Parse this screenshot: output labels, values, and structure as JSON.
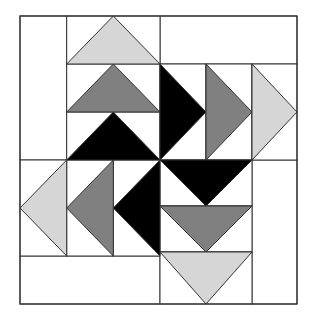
{
  "colors": {
    "background": "#ffffff",
    "stroke": "#333333",
    "light": "#d6d6d6",
    "mid": "#808080",
    "dark": "#000000"
  },
  "rects": [
    {
      "name": "top-left-bar",
      "x": 20,
      "y": 16,
      "w": 46.7,
      "h": 144
    },
    {
      "name": "top-right-bar",
      "x": 160,
      "y": 16,
      "w": 137,
      "h": 48
    },
    {
      "name": "bottom-left-bar",
      "x": 20,
      "y": 256,
      "w": 140,
      "h": 48
    },
    {
      "name": "bottom-right-bar",
      "x": 252,
      "y": 160,
      "w": 45,
      "h": 144
    },
    {
      "name": "goose-cell-up-1",
      "x": 66.7,
      "y": 16,
      "w": 93.3,
      "h": 48
    },
    {
      "name": "goose-cell-up-2",
      "x": 66.7,
      "y": 64,
      "w": 93.3,
      "h": 48
    },
    {
      "name": "goose-cell-up-3",
      "x": 66.7,
      "y": 112,
      "w": 93.3,
      "h": 48
    },
    {
      "name": "goose-cell-right-1",
      "x": 160,
      "y": 64,
      "w": 46,
      "h": 96
    },
    {
      "name": "goose-cell-right-2",
      "x": 206,
      "y": 64,
      "w": 46,
      "h": 96
    },
    {
      "name": "goose-cell-right-3",
      "x": 252,
      "y": 64,
      "w": 45,
      "h": 96
    },
    {
      "name": "goose-cell-left-1",
      "x": 20,
      "y": 160,
      "w": 46.7,
      "h": 96
    },
    {
      "name": "goose-cell-left-2",
      "x": 66.7,
      "y": 160,
      "w": 46.6,
      "h": 96
    },
    {
      "name": "goose-cell-left-3",
      "x": 113.3,
      "y": 160,
      "w": 46.7,
      "h": 96
    },
    {
      "name": "goose-cell-down-1",
      "x": 160,
      "y": 160,
      "w": 92,
      "h": 46
    },
    {
      "name": "goose-cell-down-2",
      "x": 160,
      "y": 206,
      "w": 92,
      "h": 46
    },
    {
      "name": "goose-cell-down-3",
      "x": 160,
      "y": 252,
      "w": 92,
      "h": 52
    }
  ],
  "triangles": [
    {
      "name": "goose-up-light",
      "fill": "light",
      "points": "66.7,64 113.3,16 160,64"
    },
    {
      "name": "goose-up-mid",
      "fill": "mid",
      "points": "66.7,112 113.3,64 160,112"
    },
    {
      "name": "goose-up-dark",
      "fill": "dark",
      "points": "66.7,160 113.3,112 160,160"
    },
    {
      "name": "goose-right-dark",
      "fill": "dark",
      "points": "160,64 206,112 160,160"
    },
    {
      "name": "goose-right-mid",
      "fill": "mid",
      "points": "206,64 252,112 206,160"
    },
    {
      "name": "goose-right-light",
      "fill": "light",
      "points": "252,64 297,112 252,160"
    },
    {
      "name": "goose-left-light",
      "fill": "light",
      "points": "66.7,160 20,208 66.7,256"
    },
    {
      "name": "goose-left-mid",
      "fill": "mid",
      "points": "113.3,160 66.7,208 113.3,256"
    },
    {
      "name": "goose-left-dark",
      "fill": "dark",
      "points": "160,160 113.3,208 160,256"
    },
    {
      "name": "goose-down-dark",
      "fill": "dark",
      "points": "160,160 206,206 252,160"
    },
    {
      "name": "goose-down-mid",
      "fill": "mid",
      "points": "160,206 206,252 252,206"
    },
    {
      "name": "goose-down-light",
      "fill": "light",
      "points": "160,252 206,304 252,252"
    }
  ]
}
